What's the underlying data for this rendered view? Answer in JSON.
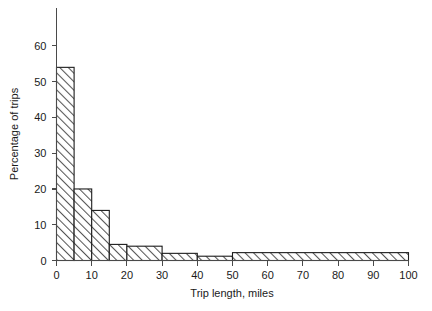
{
  "chart_data": {
    "type": "bar",
    "title": "",
    "subtitle": "",
    "xlabel": "Trip length, miles",
    "ylabel": "Percentage of trips",
    "xlim": [
      0,
      100
    ],
    "ylim": [
      0,
      65
    ],
    "grid": false,
    "legend": null,
    "xticks": [
      0,
      10,
      20,
      30,
      40,
      50,
      60,
      70,
      80,
      90,
      100
    ],
    "xtick_labels": [
      "0",
      "10",
      "20",
      "30",
      "40",
      "50",
      "60",
      "70",
      "80",
      "90",
      "100"
    ],
    "yticks": [
      0,
      10,
      20,
      30,
      40,
      50,
      60
    ],
    "ytick_labels": [
      "0",
      "10",
      "20",
      "30",
      "40",
      "50",
      "60"
    ],
    "bins": [
      {
        "label": "0-5",
        "x0": 0,
        "x1": 5,
        "value": 54.0
      },
      {
        "label": "5-10",
        "x0": 5,
        "x1": 10,
        "value": 20.0
      },
      {
        "label": "10-15",
        "x0": 10,
        "x1": 15,
        "value": 14.0
      },
      {
        "label": "15-20",
        "x0": 15,
        "x1": 20,
        "value": 4.5
      },
      {
        "label": "20-30",
        "x0": 20,
        "x1": 30,
        "value": 4.0
      },
      {
        "label": "30-40",
        "x0": 30,
        "x1": 40,
        "value": 2.0
      },
      {
        "label": "40-50",
        "x0": 40,
        "x1": 50,
        "value": 1.2
      },
      {
        "label": "50-100",
        "x0": 50,
        "x1": 100,
        "value": 2.2
      }
    ],
    "categories": [
      "0-5",
      "5-10",
      "10-15",
      "15-20",
      "20-30",
      "30-40",
      "40-50",
      "50-100"
    ],
    "values": [
      54.0,
      20.0,
      14.0,
      4.5,
      4.0,
      2.0,
      1.2,
      2.2
    ],
    "colors": {
      "bar_fill": "#ffffff",
      "bar_hatch": "#555555",
      "bar_edge": "#1d1d1d",
      "axis": "#4a4a4a",
      "text": "#1a1a1a",
      "background": "#ffffff"
    }
  }
}
